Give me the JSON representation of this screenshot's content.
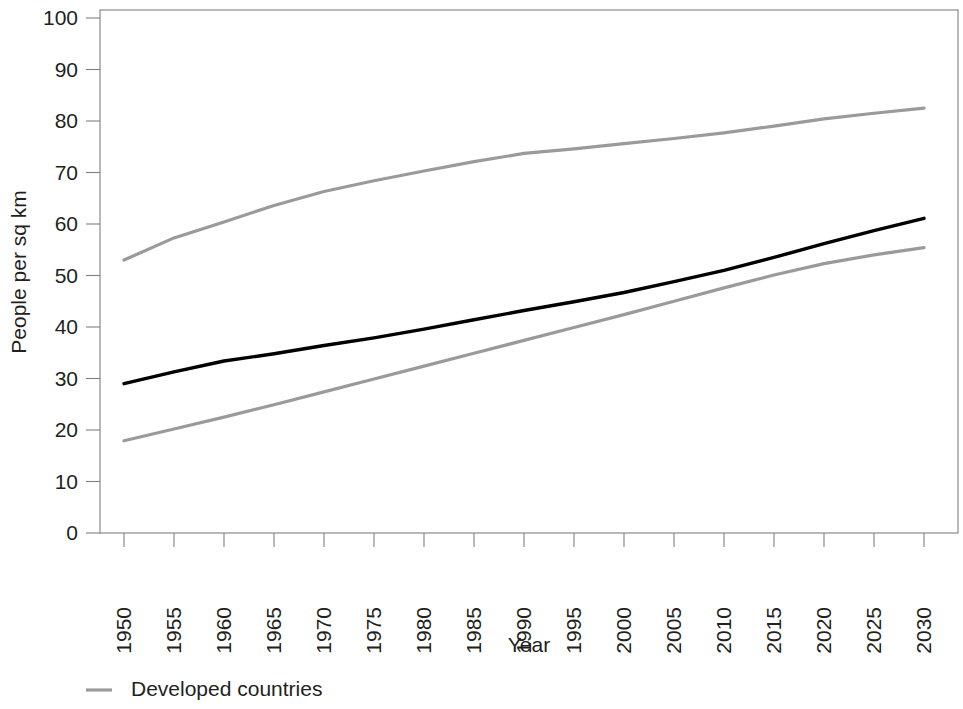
{
  "chart_data": {
    "type": "line",
    "title": "",
    "xlabel": "Year",
    "ylabel": "People per sq km",
    "xlim": [
      1950,
      2030
    ],
    "ylim": [
      0,
      100
    ],
    "grid": false,
    "legend_position": "bottom-left",
    "x": [
      1950,
      1955,
      1960,
      1965,
      1970,
      1975,
      1980,
      1985,
      1990,
      1995,
      2000,
      2005,
      2010,
      2015,
      2020,
      2025,
      2030
    ],
    "xtick_labels": [
      "1950",
      "1955",
      "1960",
      "1965",
      "1970",
      "1975",
      "1980",
      "1985",
      "1990",
      "1995",
      "2000",
      "2005",
      "2010",
      "2015",
      "2020",
      "2025",
      "2030"
    ],
    "ytick_labels": [
      "0",
      "10",
      "20",
      "30",
      "40",
      "50",
      "60",
      "70",
      "80",
      "90",
      "100"
    ],
    "ytick_values": [
      0,
      10,
      20,
      30,
      40,
      50,
      60,
      70,
      80,
      90,
      100
    ],
    "series": [
      {
        "name": "upper-gray-series",
        "color": "#9a9a9a",
        "width": 3.2,
        "values": [
          53.0,
          57.3,
          60.4,
          63.6,
          66.3,
          68.4,
          70.3,
          72.1,
          73.7,
          74.6,
          75.6,
          76.6,
          77.7,
          79.0,
          80.4,
          81.5,
          82.5
        ]
      },
      {
        "name": "black-series",
        "color": "#000000",
        "width": 3.4,
        "values": [
          29.0,
          31.3,
          33.4,
          34.8,
          36.4,
          37.9,
          39.6,
          41.4,
          43.2,
          44.9,
          46.7,
          48.8,
          51.0,
          53.5,
          56.2,
          58.7,
          61.1
        ]
      },
      {
        "name": "lower-gray-series",
        "color": "#9a9a9a",
        "width": 3.2,
        "values": [
          17.9,
          20.2,
          22.5,
          24.9,
          27.4,
          29.9,
          32.4,
          34.9,
          37.4,
          39.9,
          42.4,
          45.0,
          47.6,
          50.1,
          52.3,
          54.0,
          55.4
        ]
      }
    ],
    "legend": [
      {
        "label": "Developed countries",
        "color": "#9a9a9a"
      }
    ]
  },
  "axis": {
    "x_title": "Year",
    "y_title": "People per sq km"
  }
}
